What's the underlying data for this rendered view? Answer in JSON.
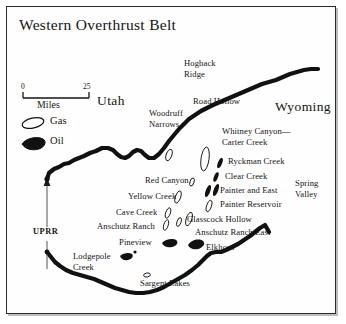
{
  "map": {
    "title": "Western Overthrust Belt",
    "background_color": "#fefefe",
    "border_color": "#2b2b2b",
    "ink_color": "#111111"
  },
  "scale_bar": {
    "min_label": "0",
    "max_label": "25",
    "unit_label": "Miles"
  },
  "legend": {
    "items": [
      {
        "label": "Gas",
        "symbol": "gas-ellipse-open",
        "fill": "#ffffff",
        "stroke": "#111111"
      },
      {
        "label": "Oil",
        "symbol": "oil-blob-filled",
        "fill": "#111111",
        "stroke": "#111111"
      }
    ]
  },
  "states": [
    {
      "name": "Utah"
    },
    {
      "name": "Wyoming"
    }
  ],
  "regions": [
    {
      "name": "Spring Valley",
      "line1": "Spring",
      "line2": "Valley"
    }
  ],
  "railroad": {
    "name": "UPRR"
  },
  "fields": [
    {
      "name": "Hogback Ridge",
      "line1": "Hogback",
      "line2": "Ridge",
      "type": "none"
    },
    {
      "name": "Road Hollow",
      "line1": "Road Hollow",
      "line2": "",
      "type": "none"
    },
    {
      "name": "Woodruff Narrows",
      "line1": "Woodruff",
      "line2": "Narrows",
      "type": "gas"
    },
    {
      "name": "Whitney Canyon—Carter Creek",
      "line1": "Whitney Canyon—",
      "line2": "Carter Creek",
      "type": "gas"
    },
    {
      "name": "Ryckman Creek",
      "line1": "Ryckman Creek",
      "line2": "",
      "type": "oil"
    },
    {
      "name": "Clear Creek",
      "line1": "Clear Creek",
      "line2": "",
      "type": "oil"
    },
    {
      "name": "Painter and East Painter Reservoir",
      "line1": "Painter and East",
      "line2": "Painter Reservoir",
      "type": "oil"
    },
    {
      "name": "Red Canyon",
      "line1": "Red Canyon",
      "line2": "",
      "type": "gas"
    },
    {
      "name": "Yellow Creek",
      "line1": "Yellow Creek",
      "line2": "",
      "type": "gas"
    },
    {
      "name": "Cave Creek",
      "line1": "Cave Creek",
      "line2": "",
      "type": "gas"
    },
    {
      "name": "Glasscock Hollow",
      "line1": "Glasscock Hollow",
      "line2": "",
      "type": "gas"
    },
    {
      "name": "Anschutz Ranch",
      "line1": "Anschutz Ranch",
      "line2": "",
      "type": "gas"
    },
    {
      "name": "Anschutz Ranch East",
      "line1": "Anschutz Ranch East",
      "line2": "",
      "type": "gas"
    },
    {
      "name": "Pineview",
      "line1": "Pineview",
      "line2": "",
      "type": "oil"
    },
    {
      "name": "Elkhorn",
      "line1": "Elkhorn",
      "line2": "",
      "type": "oil"
    },
    {
      "name": "Lodgepole Creek",
      "line1": "Lodgepole",
      "line2": "Creek",
      "type": "oil"
    },
    {
      "name": "Sargent Lakes",
      "line1": "Sargent Lakes",
      "line2": "",
      "type": "gas"
    }
  ]
}
